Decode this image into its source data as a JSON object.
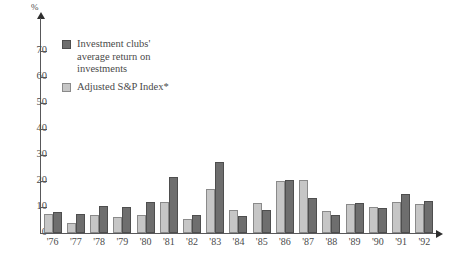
{
  "chart_data": {
    "type": "bar",
    "title": "",
    "xlabel": "",
    "ylabel": "%",
    "ylim": [
      0,
      75
    ],
    "ytick_values": [
      0,
      10,
      20,
      30,
      40,
      50,
      60,
      70
    ],
    "ytick_labels": [
      "0",
      "10",
      "20",
      "30",
      "40",
      "50",
      "60",
      "70"
    ],
    "grid": false,
    "legend_position": "upper-left-inside",
    "categories": [
      "'76",
      "'77",
      "'78",
      "'79",
      "'80",
      "'81",
      "'82",
      "'83",
      "'84",
      "'85",
      "'86",
      "'87",
      "'88",
      "'89",
      "'90",
      "'91",
      "'92"
    ],
    "series": [
      {
        "name": "Adjusted S&P Index*",
        "color": "#c6c6c6",
        "values": [
          7.5,
          4.0,
          7.0,
          6.0,
          7.0,
          12.0,
          5.5,
          17.0,
          9.0,
          11.5,
          20.0,
          20.5,
          8.5,
          11.0,
          10.0,
          12.0,
          11.0
        ]
      },
      {
        "name": "Investment clubs' average return on investments",
        "color": "#6e6e6e",
        "values": [
          8.0,
          7.5,
          10.5,
          10.0,
          12.0,
          21.5,
          7.0,
          27.5,
          6.5,
          9.0,
          20.5,
          13.5,
          7.0,
          11.5,
          9.5,
          15.0,
          12.5
        ]
      }
    ]
  },
  "axis": {
    "unit_label": "%",
    "ticks": [
      "0",
      "10",
      "20",
      "30",
      "40",
      "50",
      "60",
      "70"
    ],
    "years": [
      "'76",
      "'77",
      "'78",
      "'79",
      "'80",
      "'81",
      "'82",
      "'83",
      "'84",
      "'85",
      "'86",
      "'87",
      "'88",
      "'89",
      "'90",
      "'91",
      "'92"
    ]
  },
  "legend": {
    "items": [
      {
        "label": "Investment clubs'\naverage return on\ninvestments",
        "color": "#6e6e6e",
        "swatch": "dark-gray"
      },
      {
        "label": "Adjusted S&P Index*",
        "color": "#c6c6c6",
        "swatch": "light-gray"
      }
    ]
  },
  "colors": {
    "series_clubs": "#6e6e6e",
    "series_sp": "#c6c6c6",
    "axis": "#58585a",
    "text": "#4a4a4a",
    "background": "#ffffff"
  }
}
